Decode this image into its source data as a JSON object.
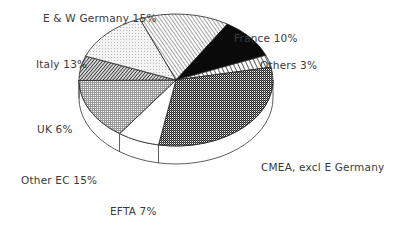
{
  "chart_data": {
    "type": "pie",
    "style": "3d-oblique",
    "title": "",
    "start": "top-left, clockwise",
    "slices": [
      {
        "name": "E & W Germany",
        "value": 15,
        "label": "E & W Germany 15%",
        "pattern": "diag-hatch-light"
      },
      {
        "name": "France",
        "value": 10,
        "label": "France 10%",
        "pattern": "solid-black"
      },
      {
        "name": "Others",
        "value": 3,
        "label": "Others 3%",
        "pattern": "diag-stripe-wide"
      },
      {
        "name": "CMEA, excl E Germany",
        "value": 31,
        "label": "CMEA, excl E Germany",
        "pattern": "checker-dark"
      },
      {
        "name": "EFTA",
        "value": 7,
        "label": "EFTA 7%",
        "pattern": "white"
      },
      {
        "name": "Other EC",
        "value": 15,
        "label": "Other EC 15%",
        "pattern": "grid-light"
      },
      {
        "name": "UK",
        "value": 6,
        "label": "UK 6%",
        "pattern": "diag-hatch-dark"
      },
      {
        "name": "Italy",
        "value": 13,
        "label": "Italy 13%",
        "pattern": "dots-light"
      }
    ]
  }
}
